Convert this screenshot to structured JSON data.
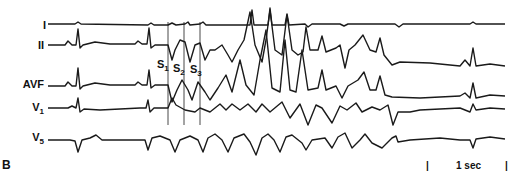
{
  "figure": {
    "panel_label": "B",
    "leads": [
      {
        "name": "I",
        "sub": ""
      },
      {
        "name": "II",
        "sub": ""
      },
      {
        "name": "AVF",
        "sub": ""
      },
      {
        "name": "V",
        "sub": "1"
      },
      {
        "name": "V",
        "sub": "5"
      }
    ],
    "stimuli": [
      {
        "name": "S",
        "sub": "1"
      },
      {
        "name": "S",
        "sub": "2"
      },
      {
        "name": "S",
        "sub": "3"
      }
    ],
    "scale_bar": {
      "label": "1 sec"
    },
    "trace_color": "#1a1a1a"
  }
}
